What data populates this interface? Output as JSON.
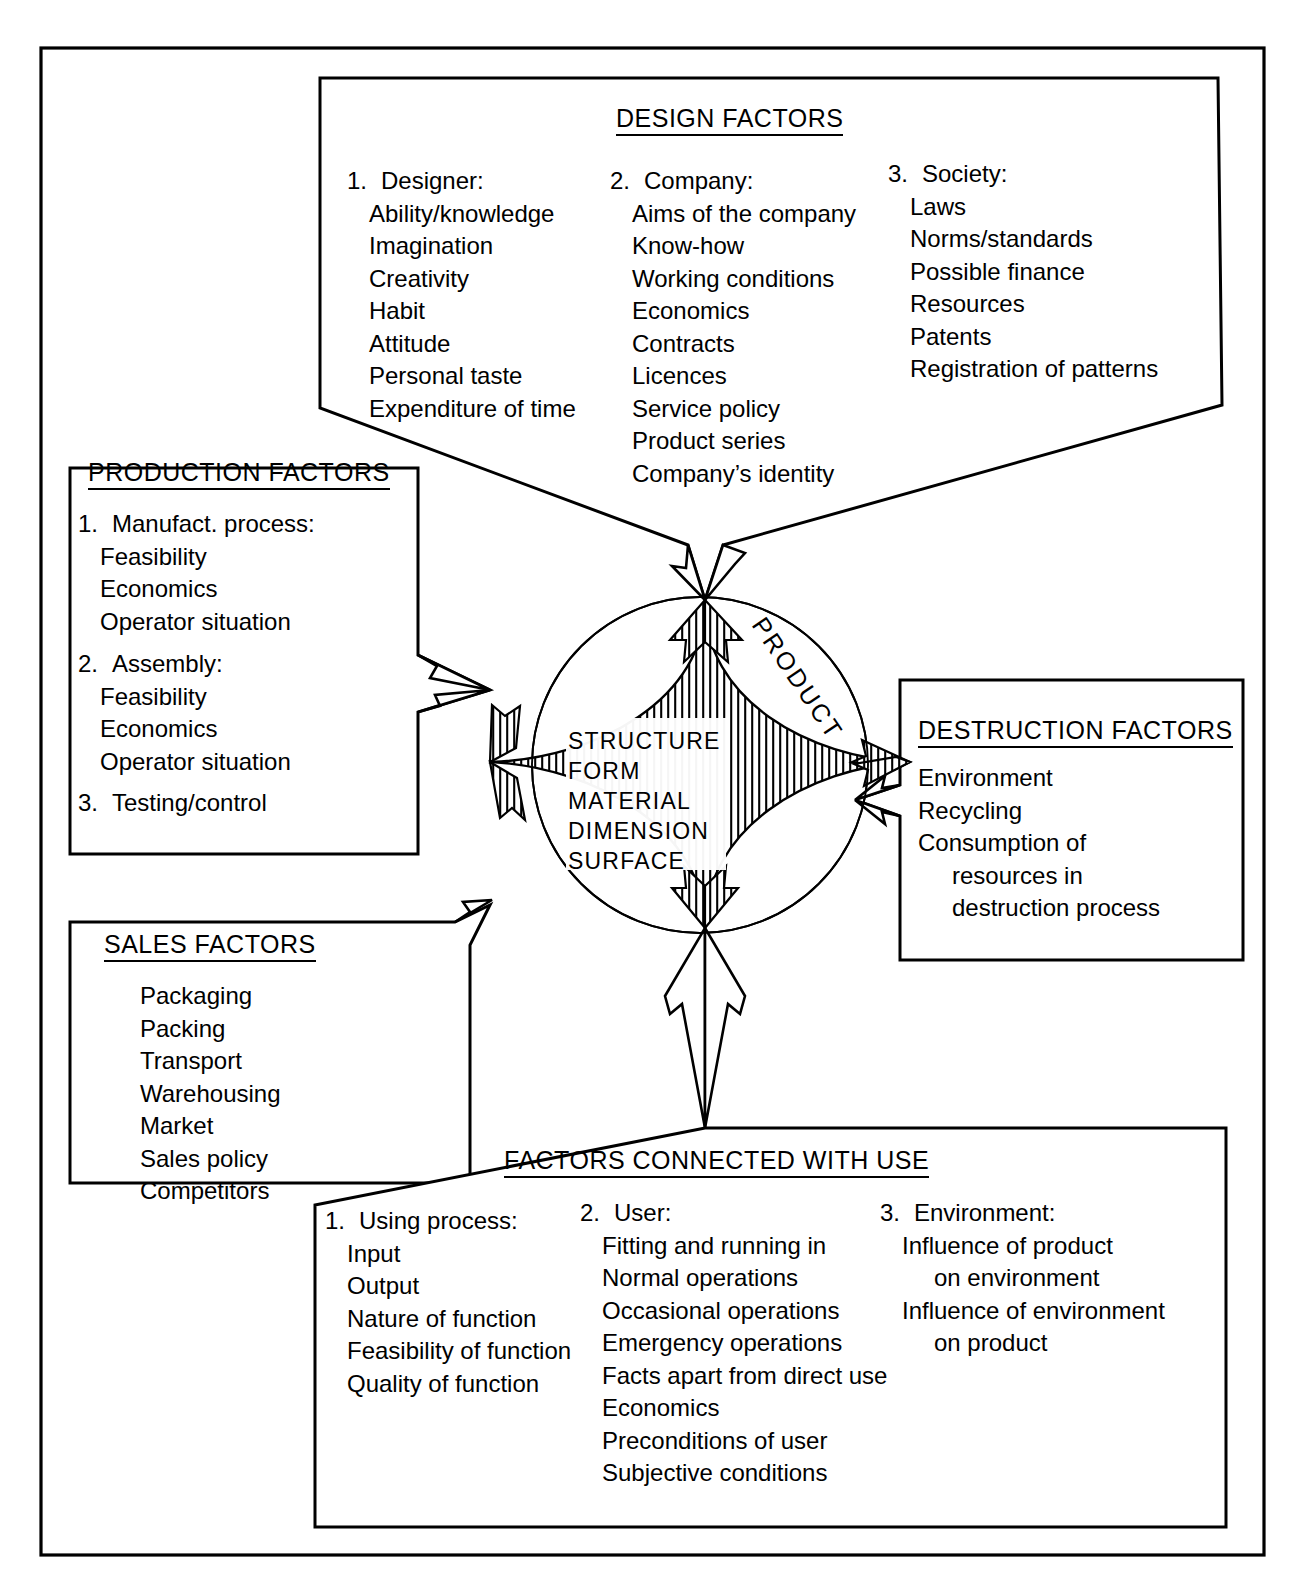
{
  "diagram": {
    "center": {
      "circle_label": "PRODUCT",
      "core_lines": [
        "STRUCTURE",
        "FORM",
        "MATERIAL",
        "DIMENSION",
        "SURFACE"
      ]
    },
    "boxes": {
      "design": {
        "title": "DESIGN FACTORS",
        "columns": [
          {
            "number": "1.",
            "heading": "Designer:",
            "items": [
              "Ability/knowledge",
              "Imagination",
              "Creativity",
              "Habit",
              "Attitude",
              "Personal taste",
              "Expenditure of time"
            ]
          },
          {
            "number": "2.",
            "heading": "Company:",
            "items": [
              "Aims of the company",
              "Know-how",
              "Working conditions",
              "Economics",
              "Contracts",
              "Licences",
              "Service policy",
              "Product series",
              "Company’s identity"
            ]
          },
          {
            "number": "3.",
            "heading": "Society:",
            "items": [
              "Laws",
              "Norms/standards",
              "Possible finance",
              "Resources",
              "Patents",
              "Registration of patterns"
            ]
          }
        ]
      },
      "production": {
        "title": "PRODUCTION FACTORS",
        "groups": [
          {
            "number": "1.",
            "heading": "Manufact. process:",
            "items": [
              "Feasibility",
              "Economics",
              "Operator situation"
            ]
          },
          {
            "number": "2.",
            "heading": "Assembly:",
            "items": [
              "Feasibility",
              "Economics",
              "Operator situation"
            ]
          },
          {
            "number": "3.",
            "heading": "Testing/control",
            "items": []
          }
        ]
      },
      "sales": {
        "title": "SALES FACTORS",
        "items": [
          "Packaging",
          "Packing",
          "Transport",
          "Warehousing",
          "Market",
          "Sales policy",
          "Competitors"
        ]
      },
      "destruction": {
        "title": "DESTRUCTION FACTORS",
        "items": [
          "Environment",
          "Recycling",
          "Consumption of"
        ],
        "items_indented": [
          "resources in",
          "destruction process"
        ]
      },
      "use": {
        "title": "FACTORS CONNECTED WITH USE",
        "columns": [
          {
            "number": "1.",
            "heading": "Using process:",
            "items": [
              "Input",
              "Output",
              "Nature of function",
              "Feasibility of function",
              "Quality of function"
            ]
          },
          {
            "number": "2.",
            "heading": "User:",
            "items": [
              "Fitting and running in",
              "Normal operations",
              "Occasional operations",
              "Emergency operations",
              "Facts apart from direct use",
              "Economics",
              "Preconditions of user",
              "Subjective conditions"
            ]
          },
          {
            "number": "3.",
            "heading": "Environment:",
            "items": [
              "Influence of product",
              "on environment",
              "Influence of environment",
              "on product"
            ],
            "indented_items": [
              "on environment",
              "on product"
            ]
          }
        ]
      }
    },
    "colors": {
      "stroke": "#000000",
      "background": "#ffffff"
    }
  }
}
